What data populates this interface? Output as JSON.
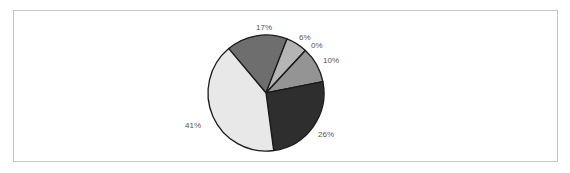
{
  "chart_data": {
    "type": "pie",
    "title": "",
    "start_angle_deg": -40,
    "direction": "clockwise",
    "slices": [
      {
        "label": "17%",
        "value": 17,
        "color": "#6e6e6e"
      },
      {
        "label": "6%",
        "value": 6,
        "color": "#b5b5b5"
      },
      {
        "label": "0%",
        "value": 0,
        "color": "#d0d0d0"
      },
      {
        "label": "10%",
        "value": 10,
        "color": "#949494"
      },
      {
        "label": "26%",
        "value": 26,
        "color": "#2e2e2e"
      },
      {
        "label": "41%",
        "value": 41,
        "color": "#e8e8e8"
      }
    ],
    "legend": null,
    "grid": false
  },
  "labels": {
    "s17": "17%",
    "s6": "6%",
    "s0": "0%",
    "s10": "10%",
    "s26": "26%",
    "s41": "41%"
  }
}
